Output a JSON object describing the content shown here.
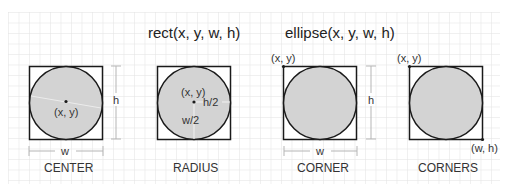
{
  "titles": {
    "rect": "rect(x, y, w, h)",
    "ellipse": "ellipse(x, y, w, h)"
  },
  "colors": {
    "background": "#ffffff",
    "grid": "#e2e2e2",
    "shape_fill": "#d3d3d3",
    "stroke": "#1a1a1a",
    "text": "#333333",
    "dimension_line": "#b5b5b5"
  },
  "panels": [
    {
      "mode": "CENTER",
      "labels": {
        "point": "(x, y)",
        "width": "w",
        "height": "h"
      }
    },
    {
      "mode": "RADIUS",
      "labels": {
        "point": "(x, y)",
        "half_height": "h/2",
        "half_width": "w/2"
      }
    },
    {
      "mode": "CORNER",
      "labels": {
        "point": "(x, y)",
        "width": "w",
        "height": "h"
      }
    },
    {
      "mode": "CORNERS",
      "labels": {
        "point": "(x, y)",
        "opposite_point": "(w, h)"
      }
    }
  ]
}
